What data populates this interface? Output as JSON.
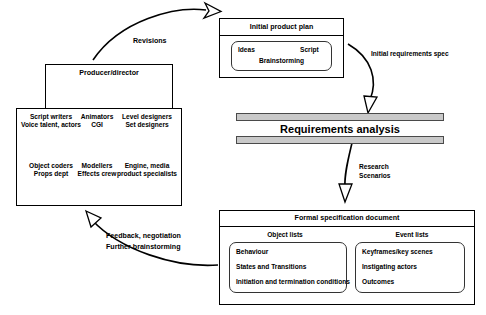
{
  "diagram": {
    "type": "process-flow"
  },
  "team": {
    "producer_box": {
      "label": "Producer/director"
    },
    "staff_box": {
      "columns": [
        {
          "top_label_line1": "Script writers",
          "top_label_line2": "Voice talent, actors",
          "bottom_label_line1": "Object coders",
          "bottom_label_line2": "Props dept"
        },
        {
          "top_label_line1": "Animators",
          "top_label_line2": "CGI",
          "bottom_label_line1": "Modellers",
          "bottom_label_line2": "Effects crew"
        },
        {
          "top_label_line1": "Level designers",
          "top_label_line2": "Set designers",
          "bottom_label_line1": "Engine, media",
          "bottom_label_line2": "product specialists"
        }
      ]
    }
  },
  "initial_plan": {
    "header": "Initial product plan",
    "inner": {
      "left": "Ideas",
      "right": "Script",
      "center": "Brainstorming"
    }
  },
  "requirements": {
    "label": "Requirements analysis"
  },
  "formal_spec": {
    "header": "Formal specification document",
    "object_lists": {
      "header": "Object lists",
      "items": [
        "Behaviour",
        "States and Transitions",
        "Initiation and termination conditions"
      ]
    },
    "event_lists": {
      "header": "Event lists",
      "items": [
        "Keyframes/key scenes",
        "Instigating actors",
        "Outcomes"
      ]
    }
  },
  "arrows": {
    "revisions": "Revisions",
    "initial_requirements_spec": "Initial requirements spec",
    "research_line1": "Research",
    "research_line2": "Scenarios",
    "feedback_line1": "Feedback, negotiation",
    "feedback_line2": "Further brainstorming"
  },
  "colors": {
    "bar_fill": "#c9c9c9",
    "bar_stroke": "#4a4a4a",
    "line": "#000000",
    "background": "#ffffff"
  }
}
